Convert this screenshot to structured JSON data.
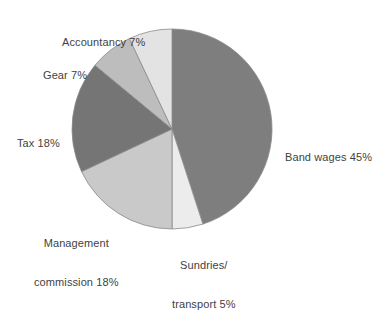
{
  "chart_data": {
    "type": "pie",
    "title": "",
    "subtitle": "",
    "xlabel": "",
    "ylabel": "",
    "legend_position": "none",
    "grid": false,
    "start_angle_deg": 0,
    "direction": "clockwise",
    "center": {
      "x": 172,
      "y": 129
    },
    "radius": 100,
    "categories": [
      "Band wages",
      "Sundries/transport",
      "Management commission",
      "Tax",
      "Gear",
      "Accountancy"
    ],
    "values": [
      45,
      5,
      18,
      18,
      7,
      7
    ],
    "unit": "%",
    "colors": [
      "#7e7e7e",
      "#ececec",
      "#c9c9c9",
      "#757575",
      "#bdbdbd",
      "#e3e3e3"
    ],
    "slices": [
      {
        "name": "Band wages",
        "value": 45,
        "label": "Band wages 45%",
        "color": "#7e7e7e",
        "start_deg": 0,
        "end_deg": 162
      },
      {
        "name": "Sundries/transport",
        "value": 5,
        "label_line1": "Sundries/",
        "label_line2": "transport 5%",
        "color": "#ececec",
        "start_deg": 162,
        "end_deg": 180
      },
      {
        "name": "Management commission",
        "value": 18,
        "label_line1": "Management",
        "label_line2": "commission 18%",
        "color": "#c9c9c9",
        "start_deg": 180,
        "end_deg": 244.8
      },
      {
        "name": "Tax",
        "value": 18,
        "label": "Tax 18%",
        "color": "#757575",
        "start_deg": 244.8,
        "end_deg": 309.6
      },
      {
        "name": "Gear",
        "value": 7,
        "label": "Gear 7%",
        "color": "#bdbdbd",
        "start_deg": 309.6,
        "end_deg": 334.8
      },
      {
        "name": "Accountancy",
        "value": 7,
        "label": "Accountancy 7%",
        "color": "#e3e3e3",
        "start_deg": 334.8,
        "end_deg": 360
      }
    ]
  },
  "labels": {
    "accountancy": "Accountancy 7%",
    "gear": "Gear 7%",
    "tax": "Tax 18%",
    "management_line1": "Management",
    "management_line2": "commission 18%",
    "sundries_line1": "Sundries/",
    "sundries_line2": "transport 5%",
    "band_wages": "Band wages 45%"
  },
  "style": {
    "background": "#ffffff",
    "text_color": "#3f3f3f",
    "slice_outline": "#8a8a8a"
  }
}
